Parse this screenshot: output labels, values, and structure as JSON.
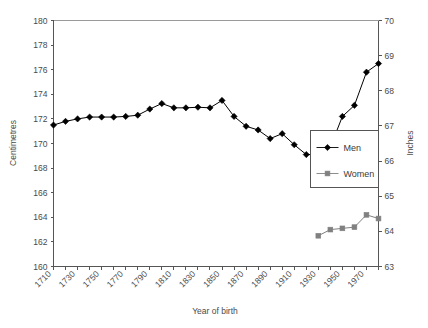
{
  "chart_data": {
    "type": "line",
    "title": "",
    "xlabel": "Year of birth",
    "ylabel": "Centimetres",
    "y2label": "Inches",
    "xlim": [
      1710,
      1980
    ],
    "ylim": [
      160,
      180
    ],
    "y2lim": [
      63,
      70
    ],
    "grid": false,
    "legend_position": "center-right",
    "x_tick_labels": [
      "1710",
      "1730",
      "1750",
      "1770",
      "1790",
      "1810",
      "1830",
      "1850",
      "1870",
      "1890",
      "1910",
      "1930",
      "1950",
      "1970"
    ],
    "x_tick_values": [
      1710,
      1730,
      1750,
      1770,
      1790,
      1810,
      1830,
      1850,
      1870,
      1890,
      1910,
      1930,
      1950,
      1970
    ],
    "x_minor_step": 10,
    "y_tick_labels": [
      "160",
      "162",
      "164",
      "166",
      "168",
      "170",
      "172",
      "174",
      "176",
      "178",
      "180"
    ],
    "y_tick_values": [
      160,
      162,
      164,
      166,
      168,
      170,
      172,
      174,
      176,
      178,
      180
    ],
    "y2_tick_labels": [
      "63",
      "64",
      "65",
      "66",
      "67",
      "68",
      "69",
      "70"
    ],
    "y2_tick_values": [
      63,
      64,
      65,
      66,
      67,
      68,
      69,
      70
    ],
    "series": [
      {
        "name": "Men",
        "marker": "diamond",
        "color": "#000000",
        "x": [
          1710,
          1720,
          1730,
          1740,
          1750,
          1760,
          1770,
          1780,
          1790,
          1800,
          1810,
          1820,
          1830,
          1840,
          1850,
          1860,
          1870,
          1880,
          1890,
          1900,
          1910,
          1920,
          1930,
          1940,
          1950,
          1960,
          1970,
          1980
        ],
        "values": [
          171.5,
          171.8,
          172.0,
          172.15,
          172.15,
          172.15,
          172.2,
          172.3,
          172.8,
          173.25,
          172.9,
          172.9,
          172.95,
          172.9,
          173.5,
          172.2,
          171.4,
          171.1,
          170.4,
          170.8,
          169.9,
          169.1,
          169.1,
          169.7,
          172.2,
          173.1,
          175.8,
          176.5
        ]
      },
      {
        "name": "Women",
        "marker": "square",
        "color": "#808080",
        "x": [
          1930,
          1940,
          1950,
          1960,
          1970,
          1980
        ],
        "values": [
          162.5,
          163.0,
          163.1,
          163.2,
          164.2,
          163.9
        ]
      }
    ],
    "legend_entries": [
      {
        "label": "Men",
        "marker": "diamond",
        "color": "#000000"
      },
      {
        "label": "Women",
        "marker": "square",
        "color": "#808080"
      }
    ]
  }
}
